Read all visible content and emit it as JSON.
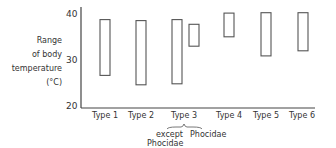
{
  "chart_data": {
    "type": "range-bar",
    "title": "",
    "ylabel": "Range of body temperature (°C)",
    "ylabel_lines": [
      "Range",
      "of body",
      "temperature",
      "(°C)"
    ],
    "xlabel": "",
    "ylim": [
      20,
      41
    ],
    "yticks": [
      20,
      30,
      40
    ],
    "grid": false,
    "legend": null,
    "categories": [
      "Type 1",
      "Type 2",
      "Type 3",
      "Type 4",
      "Type 5",
      "Type 6"
    ],
    "bars": [
      {
        "category": "Type 1",
        "label": "Type 1",
        "min": 27,
        "max": 39
      },
      {
        "category": "Type 2",
        "label": "Type 2",
        "min": 25,
        "max": 38.8
      },
      {
        "category": "Type 3",
        "label": "except Phocidae",
        "min": 25.2,
        "max": 39
      },
      {
        "category": "Type 3",
        "label": "Phocidae",
        "min": 33.3,
        "max": 38
      },
      {
        "category": "Type 4",
        "label": "Type 4",
        "min": 35.3,
        "max": 40.4
      },
      {
        "category": "Type 5",
        "label": "Type 5",
        "min": 31.2,
        "max": 40.5
      },
      {
        "category": "Type 6",
        "label": "Type 6",
        "min": 32.3,
        "max": 40.5
      }
    ],
    "annotations": [
      "except Phocidae",
      "Phocidae"
    ]
  },
  "axis": {
    "y_label": [
      "Range",
      "of body",
      "temperature",
      "(°C)"
    ],
    "ticks": [
      "40",
      "30",
      "20"
    ]
  },
  "x_labels": [
    "Type 1",
    "Type 2",
    "Type 3",
    "Type 4",
    "Type 5",
    "Type 6"
  ],
  "type3_sub": {
    "left": "except",
    "left2": "Phocidae",
    "right": "Phocidae"
  },
  "colors": {
    "stroke": "#555555",
    "axis": "#444444",
    "text": "#333333"
  }
}
